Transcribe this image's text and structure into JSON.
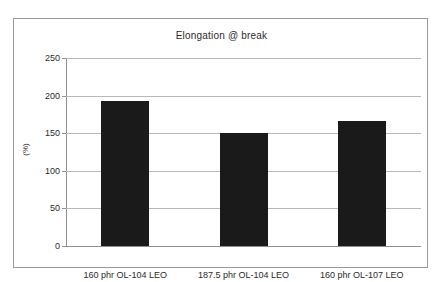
{
  "chart_data": {
    "type": "bar",
    "title": "Elongation @ break",
    "xlabel": "",
    "ylabel": "(%)",
    "categories": [
      "160 phr OL-104 LEO",
      "187.5 phr OL-104 LEO",
      "160 phr OL-107 LEO"
    ],
    "values": [
      193,
      150,
      166
    ],
    "ylim": [
      0,
      250
    ],
    "yticks": [
      0,
      50,
      100,
      150,
      200,
      250
    ],
    "ytick_labels": [
      "0",
      "50",
      "100",
      "150",
      "200",
      "250"
    ],
    "grid": true,
    "legend": false,
    "series": [
      {
        "name": "Elongation @ break",
        "values": [
          193,
          150,
          166
        ],
        "color": "#1a1a1a"
      }
    ]
  },
  "style": {
    "bar_color": "#1a1a1a",
    "grid_color": "#b9b9b9",
    "axis_color": "#8f8f8f",
    "frame_color": "#9a9a9a",
    "text_color": "#2b2b2b",
    "background": "#ffffff"
  }
}
